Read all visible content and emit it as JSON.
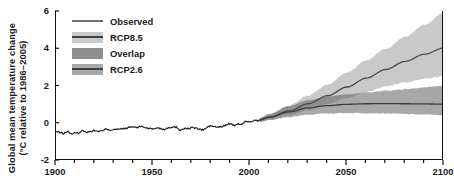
{
  "chart_data": {
    "type": "line",
    "title": "",
    "xlabel": "",
    "ylabel": "Global mean temperature change (°C relative to 1986–2005)",
    "ylabel_line1": "Global mean temperature change",
    "ylabel_line2": "(°C relative to 1986–2005)",
    "xlim": [
      1900,
      2100
    ],
    "ylim": [
      -2,
      6
    ],
    "xticks": [
      1900,
      1950,
      2000,
      2050,
      2100
    ],
    "xticklabels": [
      "1900",
      "1950",
      "2000",
      "2050",
      "2100"
    ],
    "xminor_step": 10,
    "yticks": [
      -2,
      0,
      2,
      4,
      6
    ],
    "yticklabels": [
      "-2",
      "0",
      "2",
      "4",
      "6"
    ],
    "grid": false,
    "legend_position": "top-left-inside",
    "legend": [
      {
        "label": "Observed",
        "style": "line",
        "color": "#707070"
      },
      {
        "label": "RCP8.5",
        "style": "band",
        "band_color": "#c9c9c9",
        "line_color": "#3f3f3f"
      },
      {
        "label": "Overlap",
        "style": "band",
        "band_color": "#8f8f8f",
        "line_color": "#8f8f8f"
      },
      {
        "label": "RCP2.6",
        "style": "band",
        "band_color": "#a8a8a8",
        "line_color": "#3f3f3f"
      }
    ],
    "colors": {
      "observed_line": "#1a1a1a",
      "rcp85_band": "#c9c9c9",
      "rcp85_line": "#4a4a4a",
      "rcp26_band": "#a8a8a8",
      "rcp26_line": "#3c3c3c",
      "overlap_band": "#8f8f8f",
      "axis": "#111111"
    },
    "series": [
      {
        "name": "Observed",
        "type": "line",
        "x": [
          1900,
          1902,
          1904,
          1906,
          1908,
          1910,
          1912,
          1914,
          1916,
          1918,
          1920,
          1922,
          1924,
          1926,
          1928,
          1930,
          1932,
          1934,
          1936,
          1938,
          1940,
          1942,
          1944,
          1946,
          1948,
          1950,
          1952,
          1954,
          1956,
          1958,
          1960,
          1962,
          1964,
          1966,
          1968,
          1970,
          1972,
          1974,
          1976,
          1978,
          1980,
          1982,
          1984,
          1986,
          1988,
          1990,
          1992,
          1994,
          1996,
          1998,
          2000,
          2002,
          2004,
          2005
        ],
        "values": [
          -0.48,
          -0.52,
          -0.58,
          -0.46,
          -0.6,
          -0.55,
          -0.54,
          -0.4,
          -0.52,
          -0.45,
          -0.42,
          -0.46,
          -0.44,
          -0.32,
          -0.4,
          -0.34,
          -0.36,
          -0.33,
          -0.3,
          -0.24,
          -0.22,
          -0.26,
          -0.18,
          -0.26,
          -0.3,
          -0.34,
          -0.26,
          -0.31,
          -0.36,
          -0.24,
          -0.26,
          -0.22,
          -0.4,
          -0.3,
          -0.32,
          -0.26,
          -0.28,
          -0.36,
          -0.38,
          -0.24,
          -0.16,
          -0.22,
          -0.24,
          -0.2,
          -0.1,
          -0.04,
          -0.16,
          -0.08,
          -0.06,
          0.1,
          0.02,
          0.12,
          0.1,
          0.14
        ]
      },
      {
        "name": "RCP8.5",
        "type": "band_with_mean",
        "x": [
          2005,
          2010,
          2020,
          2030,
          2040,
          2050,
          2060,
          2070,
          2080,
          2090,
          2100
        ],
        "mean": [
          0.16,
          0.3,
          0.63,
          1.02,
          1.45,
          1.92,
          2.4,
          2.86,
          3.3,
          3.68,
          4.02
        ],
        "lower": [
          0.06,
          0.16,
          0.4,
          0.68,
          1.0,
          1.33,
          1.65,
          1.95,
          2.18,
          2.36,
          2.5
        ],
        "upper": [
          0.26,
          0.46,
          0.92,
          1.46,
          2.05,
          2.7,
          3.35,
          3.98,
          4.62,
          5.28,
          5.9
        ]
      },
      {
        "name": "RCP2.6",
        "type": "band_with_mean",
        "x": [
          2005,
          2010,
          2020,
          2030,
          2040,
          2050,
          2060,
          2070,
          2080,
          2090,
          2100
        ],
        "mean": [
          0.16,
          0.3,
          0.58,
          0.8,
          0.92,
          0.99,
          1.02,
          1.03,
          1.02,
          1.01,
          1.0
        ],
        "lower": [
          0.06,
          0.14,
          0.3,
          0.44,
          0.5,
          0.52,
          0.52,
          0.5,
          0.47,
          0.44,
          0.42
        ],
        "upper": [
          0.26,
          0.46,
          0.88,
          1.2,
          1.4,
          1.52,
          1.62,
          1.72,
          1.8,
          1.9,
          1.98
        ]
      }
    ],
    "annotations": []
  }
}
